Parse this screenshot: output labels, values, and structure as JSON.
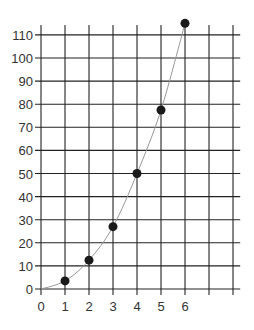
{
  "chart_data": {
    "type": "scatter",
    "title": "",
    "xlabel": "",
    "ylabel": "",
    "x_ticks": [
      "0",
      "1",
      "2",
      "3",
      "4",
      "5",
      "6"
    ],
    "y_ticks": [
      "0",
      "10",
      "20",
      "30",
      "40",
      "50",
      "60",
      "70",
      "80",
      "90",
      "100",
      "110"
    ],
    "xlim": [
      0,
      8
    ],
    "ylim": [
      0,
      110
    ],
    "grid": true,
    "legend": null,
    "series": [
      {
        "name": "data points",
        "x": [
          1,
          2,
          3,
          4,
          5,
          6
        ],
        "y": [
          3.5,
          12.5,
          27,
          50,
          77.5,
          115
        ],
        "marker": "filled-circle",
        "color": "#1a1a1a"
      }
    ],
    "trend_curve": {
      "description": "smooth curve through origin and points",
      "color": "#999999"
    }
  },
  "colors": {
    "grid": "#222222",
    "points": "#1a1a1a",
    "curve": "#999999",
    "text": "#333333"
  }
}
